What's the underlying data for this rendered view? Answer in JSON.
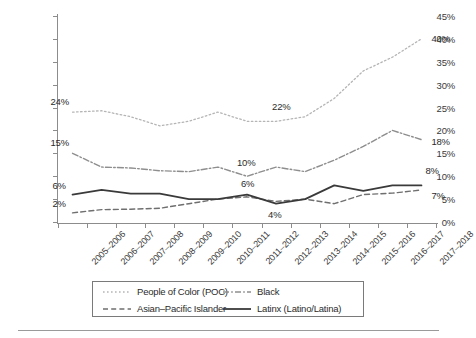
{
  "chart_data": {
    "type": "line",
    "title": "",
    "subtitle": "",
    "xlabel": "",
    "ylabel": "",
    "ylim": [
      0,
      45
    ],
    "yticks": [
      "0%",
      "5%",
      "10%",
      "15%",
      "20%",
      "25%",
      "30%",
      "35%",
      "40%",
      "45%"
    ],
    "ytick_values": [
      0,
      5,
      10,
      15,
      20,
      25,
      30,
      35,
      40,
      45
    ],
    "grid": false,
    "legend_position": "bottom",
    "categories": [
      "2005–2006",
      "2006–2007",
      "2007–2008",
      "2008–2009",
      "2009–2010",
      "2010–2011",
      "2011–2012",
      "2012–2013",
      "2013–2014",
      "2014–2015",
      "2015–2016",
      "2016–2017",
      "2017–2018"
    ],
    "series": [
      {
        "name": "People of Color (POC)",
        "style": "dotted",
        "color": "#b5b5b5",
        "values": [
          24,
          24.3,
          23,
          21,
          22,
          24,
          22,
          22,
          23,
          27,
          33,
          36,
          40
        ]
      },
      {
        "name": "Black",
        "style": "dash-dot",
        "color": "#8e8e8e",
        "values": [
          15,
          12,
          11.8,
          11.2,
          11,
          12,
          10,
          12,
          11,
          13.5,
          16.5,
          20,
          18
        ]
      },
      {
        "name": "Asian–Pacific Islander",
        "style": "dashed",
        "color": "#6f6f6f",
        "values": [
          2,
          2.7,
          2.8,
          3,
          4,
          5,
          5.5,
          4.5,
          5,
          4,
          6,
          6.3,
          7
        ]
      },
      {
        "name": "Latinx (Latino/Latina)",
        "style": "solid",
        "color": "#3a3a3a",
        "values": [
          6,
          7,
          6.2,
          6.2,
          5,
          5,
          6,
          4,
          5,
          8,
          6.8,
          8,
          8
        ]
      }
    ],
    "annotations": [
      {
        "label": "24%",
        "series": "People of Color (POC)",
        "category": "2005–2006",
        "value": 24
      },
      {
        "label": "22%",
        "series": "People of Color (POC)",
        "category": "2012–2013",
        "value": 22
      },
      {
        "label": "40%",
        "series": "People of Color (POC)",
        "category": "2017–2018",
        "value": 40
      },
      {
        "label": "15%",
        "series": "Black",
        "category": "2005–2006",
        "value": 15
      },
      {
        "label": "10%",
        "series": "Black",
        "category": "2011–2012",
        "value": 10
      },
      {
        "label": "18%",
        "series": "Black",
        "category": "2017–2018",
        "value": 18
      },
      {
        "label": "6%",
        "series": "Latinx (Latino/Latina)",
        "category": "2005–2006",
        "value": 6
      },
      {
        "label": "6%",
        "series": "Latinx (Latino/Latina)",
        "category": "2011–2012",
        "value": 6
      },
      {
        "label": "8%",
        "series": "Latinx (Latino/Latina)",
        "category": "2017–2018",
        "value": 8
      },
      {
        "label": "2%",
        "series": "Asian–Pacific Islander",
        "category": "2005–2006",
        "value": 2
      },
      {
        "label": "4%",
        "series": "Asian–Pacific Islander",
        "category": "2012–2013",
        "value": 4.5
      },
      {
        "label": "7%",
        "series": "Asian–Pacific Islander",
        "category": "2017–2018",
        "value": 7
      }
    ]
  },
  "legend": {
    "items": [
      {
        "label": "People of Color (POC)",
        "style": "dotted",
        "color": "#b5b5b5"
      },
      {
        "label": "Black",
        "style": "dash-dot",
        "color": "#8e8e8e"
      },
      {
        "label": "Asian–Pacific Islander",
        "style": "dashed",
        "color": "#6f6f6f"
      },
      {
        "label": "Latinx (Latino/Latina)",
        "style": "solid",
        "color": "#3a3a3a"
      }
    ]
  },
  "colors": {
    "axis": "#8c8c8c",
    "text": "#2b2b2b",
    "background": "#ffffff",
    "legend_border": "#7a7a7a"
  }
}
